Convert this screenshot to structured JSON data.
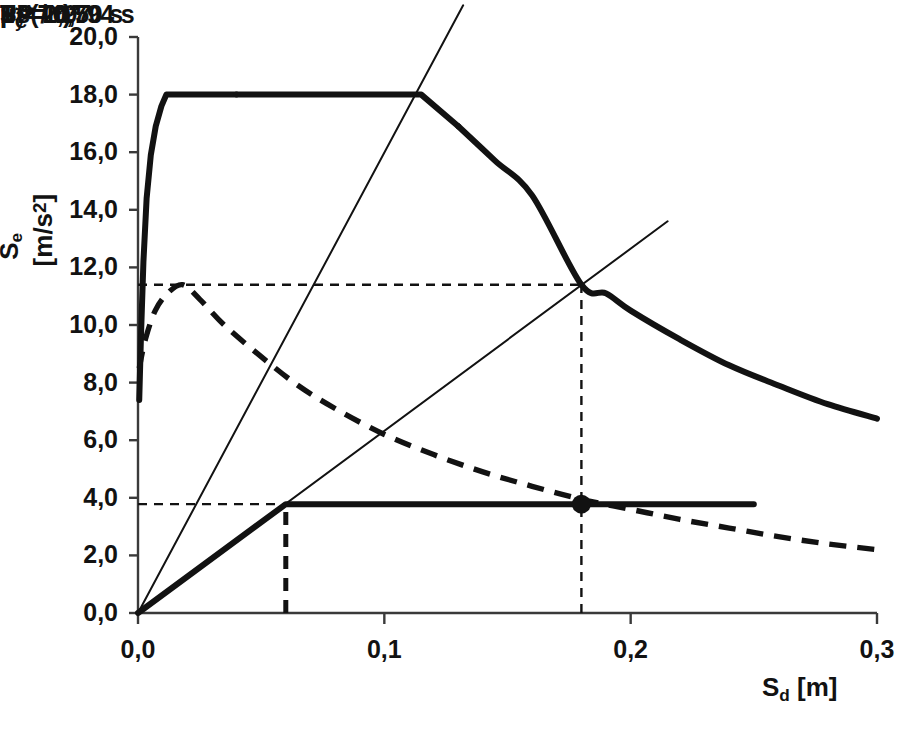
{
  "chart_data": {
    "type": "line",
    "title": "",
    "xlabel": "S_d [m]",
    "ylabel": "S_e [m/s2]",
    "xlim": [
      0,
      0.3
    ],
    "ylim": [
      0,
      20
    ],
    "xticks": [
      "0,0",
      "0,1",
      "0,2",
      "0,3"
    ],
    "xtick_values": [
      0.0,
      0.1,
      0.2,
      0.3
    ],
    "yticks": [
      "0,0",
      "2,0",
      "4,0",
      "6,0",
      "8,0",
      "10,0",
      "12,0",
      "14,0",
      "16,0",
      "18,0",
      "20,0"
    ],
    "ytick_values": [
      0,
      2,
      4,
      6,
      8,
      10,
      12,
      14,
      16,
      18,
      20
    ],
    "grid": false,
    "legend": "none",
    "series": [
      {
        "name": "mu = 1",
        "style": "solid-thick",
        "points": [
          [
            0.0005,
            7.4
          ],
          [
            0.0012,
            9.6
          ],
          [
            0.0022,
            12.2
          ],
          [
            0.0035,
            14.4
          ],
          [
            0.0052,
            15.9
          ],
          [
            0.0072,
            16.9
          ],
          [
            0.0095,
            17.6
          ],
          [
            0.0115,
            18.0
          ],
          [
            0.04,
            18.0
          ],
          [
            0.08,
            18.0
          ],
          [
            0.115,
            18.0
          ],
          [
            0.13,
            16.9
          ],
          [
            0.145,
            15.7
          ],
          [
            0.16,
            14.5
          ],
          [
            0.18,
            11.4
          ],
          [
            0.19,
            11.1
          ],
          [
            0.2,
            10.5
          ],
          [
            0.22,
            9.5
          ],
          [
            0.24,
            8.6
          ],
          [
            0.26,
            7.9
          ],
          [
            0.28,
            7.25
          ],
          [
            0.3,
            6.75
          ]
        ]
      },
      {
        "name": "mu = 2,97",
        "style": "dashed-thick",
        "points": [
          [
            0.0005,
            8.5
          ],
          [
            0.003,
            9.5
          ],
          [
            0.007,
            10.5
          ],
          [
            0.012,
            11.1
          ],
          [
            0.018,
            11.4
          ],
          [
            0.025,
            10.9
          ],
          [
            0.035,
            10.0
          ],
          [
            0.05,
            8.9
          ],
          [
            0.065,
            7.9
          ],
          [
            0.08,
            7.1
          ],
          [
            0.1,
            6.2
          ],
          [
            0.12,
            5.5
          ],
          [
            0.14,
            4.9
          ],
          [
            0.16,
            4.4
          ],
          [
            0.18,
            3.95
          ],
          [
            0.2,
            3.6
          ],
          [
            0.22,
            3.25
          ],
          [
            0.24,
            2.95
          ],
          [
            0.26,
            2.65
          ],
          [
            0.28,
            2.4
          ],
          [
            0.3,
            2.2
          ]
        ]
      },
      {
        "name": "Fy* /m*",
        "style": "solid-thick-bilinear",
        "points": [
          [
            0.0,
            0.0
          ],
          [
            0.06,
            3.78
          ],
          [
            0.25,
            3.78
          ]
        ]
      },
      {
        "name": "T_C = 0,50 s",
        "style": "thin-radial",
        "points": [
          [
            0.0,
            0.0
          ],
          [
            0.132,
            21.1
          ]
        ]
      },
      {
        "name": "T* = 0,794 s",
        "style": "thin-radial",
        "points": [
          [
            0.0,
            0.0
          ],
          [
            0.215,
            13.6
          ]
        ]
      }
    ],
    "guides": [
      {
        "name": "Se(T*) horizontal",
        "orientation": "h",
        "value": 11.4,
        "from": 0.0,
        "to": 0.18,
        "style": "dashed-thin"
      },
      {
        "name": "Fy*/m* horizontal",
        "orientation": "h",
        "value": 3.78,
        "from": 0.0,
        "to": 0.18,
        "style": "dashed-thin"
      },
      {
        "name": "dy* vertical",
        "orientation": "v",
        "value": 0.06,
        "from": 0.0,
        "to": 3.78,
        "style": "dashed-thick"
      },
      {
        "name": "dt* vertical",
        "orientation": "v",
        "value": 0.18,
        "from": 0.0,
        "to": 11.4,
        "style": "dashed-thin"
      }
    ],
    "markers": [
      {
        "name": "PP",
        "x": 0.18,
        "y": 3.78,
        "label": "PP",
        "shape": "filled-circle"
      }
    ],
    "annotations": [
      {
        "name": "Tc-label",
        "text": "Tc = 0,50 s",
        "x": 0.166,
        "y": 18.45
      },
      {
        "name": "Tstar-label",
        "text": "T* = 0,794 s",
        "x": 0.256,
        "y": 12.55
      },
      {
        "name": "Se-Tstar-label",
        "text": "Se(T*)",
        "x": 0.0185,
        "y": 12.25
      },
      {
        "name": "mu1-label",
        "text": "μ = 1",
        "x": 0.288,
        "y": 8.2
      },
      {
        "name": "mu297-label",
        "text": "μ = 2,97",
        "x": 0.276,
        "y": 1.55
      },
      {
        "name": "Fy-label",
        "text": "Fy* /m*",
        "x": 0.258,
        "y": 3.78
      },
      {
        "name": "PP-label",
        "text": "PP",
        "x": 0.188,
        "y": 4.6
      },
      {
        "name": "dy-label",
        "text": "dy*",
        "x": 0.052,
        "y": 1.35
      },
      {
        "name": "dt-label",
        "text": "dt* = det*",
        "x": 0.172,
        "y": 1.2
      }
    ]
  },
  "labels": {
    "y_axis_title_main": "S",
    "y_axis_title_sub": "e",
    "y_axis_title_unit": " [m/s",
    "y_axis_title_exp": "2",
    "y_axis_title_close": "]",
    "x_axis_title_main": "S",
    "x_axis_title_sub": "d",
    "x_axis_title_unit": " [m]",
    "tc_main": "T",
    "tc_sub": "C",
    "tc_rest": " = 0,50 s",
    "tstar": "T* = 0,794 s",
    "se_tstar": "Se(T*)",
    "mu1": "μ = 1",
    "mu297": "μ = 2,97",
    "fy_main": "F",
    "fy_sub": "y",
    "fy_rest": "* /m*",
    "pp": "PP",
    "dy_main": "d",
    "dy_sub": "y",
    "dy_star": "*",
    "dt_main": "d",
    "dt_sub": "t",
    "dt_star": "*",
    "dt_eq": " = d",
    "dt_sub2": "et",
    "dt_star2": "*"
  },
  "xticklabels": [
    "0,0",
    "0,1",
    "0,2",
    "0,3"
  ],
  "yticklabels": [
    "0,0",
    "2,0",
    "4,0",
    "6,0",
    "8,0",
    "10,0",
    "12,0",
    "14,0",
    "16,0",
    "18,0",
    "20,0"
  ],
  "colors": {
    "ink": "#121212",
    "axis": "#3a3a3a",
    "background": "#ffffff"
  }
}
